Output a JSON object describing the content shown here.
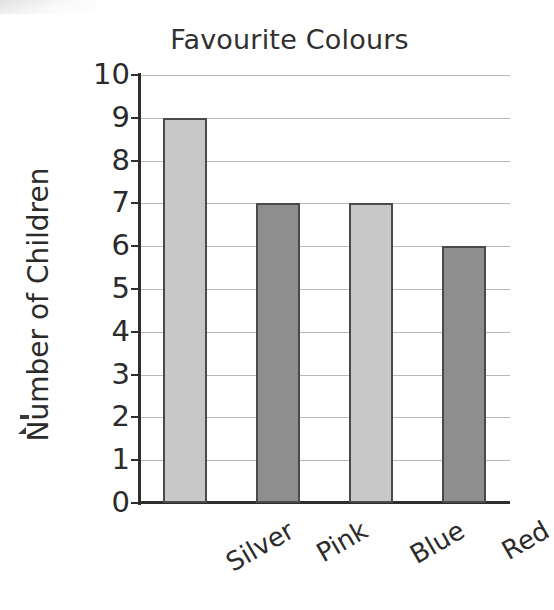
{
  "chart_data": {
    "type": "bar",
    "title": "Favourite Colours",
    "xlabel": "",
    "ylabel": "Number of Children",
    "categories": [
      "Silver",
      "Pink",
      "Blue",
      "Red"
    ],
    "values": [
      9,
      7,
      7,
      6
    ],
    "ylim": [
      0,
      10
    ],
    "ytick_labels": [
      "10",
      "9",
      "8",
      "7",
      "6",
      "5",
      "4",
      "3",
      "2",
      "1",
      "0"
    ],
    "ytick_values": [
      10,
      9,
      8,
      7,
      6,
      5,
      4,
      3,
      2,
      1,
      0
    ],
    "grid": true,
    "legend": "none",
    "bar_colors": [
      "#c8c8c8",
      "#8e8e8e",
      "#c8c8c8",
      "#8e8e8e"
    ],
    "bar_edge_color": "#4a4a4a",
    "axis_color": "#2e2e2e",
    "gridline_color": "#b9b9b9",
    "background_color": "#ffffff",
    "xtick_label_rotation": -30
  }
}
